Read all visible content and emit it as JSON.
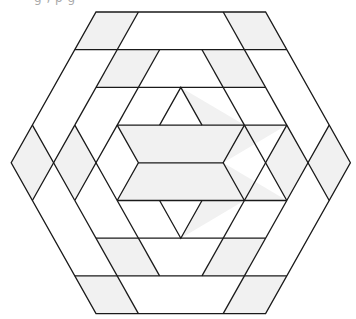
{
  "caption": "g          , p g",
  "colors": {
    "stroke": "#1a1a1a",
    "shade": "#f1f1f1",
    "background": "#ffffff"
  },
  "diagram": {
    "lattice_note": "triangular lattice; points given as [row, col], row 0..8, hexagon side = 4 units",
    "shaded_regions": [
      {
        "name": "top-left-parallelogram-outer",
        "pts": [
          [
            0,
            0
          ],
          [
            0,
            1
          ],
          [
            1,
            1
          ],
          [
            1,
            0
          ]
        ]
      },
      {
        "name": "top-right-parallelogram-outer",
        "pts": [
          [
            0,
            3
          ],
          [
            0,
            4
          ],
          [
            1,
            5
          ],
          [
            1,
            4
          ]
        ]
      },
      {
        "name": "top-left-parallelogram-inner",
        "pts": [
          [
            1,
            1
          ],
          [
            1,
            2
          ],
          [
            2,
            2
          ],
          [
            2,
            1
          ]
        ]
      },
      {
        "name": "top-right-parallelogram-inner",
        "pts": [
          [
            1,
            3
          ],
          [
            1,
            4
          ],
          [
            2,
            5
          ],
          [
            2,
            4
          ]
        ]
      },
      {
        "name": "top-triangle",
        "pts": [
          [
            2,
            3
          ],
          [
            3,
            5
          ],
          [
            3,
            4
          ]
        ]
      },
      {
        "name": "left-diamond-outer",
        "pts": [
          [
            3,
            0
          ],
          [
            4,
            1
          ],
          [
            5,
            0
          ],
          [
            4,
            0
          ]
        ]
      },
      {
        "name": "left-diamond-inner",
        "pts": [
          [
            3,
            1
          ],
          [
            4,
            2
          ],
          [
            5,
            1
          ],
          [
            4,
            1
          ]
        ]
      },
      {
        "name": "right-diamond-inner",
        "pts": [
          [
            3,
            6
          ],
          [
            4,
            7
          ],
          [
            5,
            6
          ],
          [
            4,
            6
          ]
        ]
      },
      {
        "name": "right-diamond-outer",
        "pts": [
          [
            3,
            7
          ],
          [
            4,
            8
          ],
          [
            5,
            7
          ],
          [
            4,
            7
          ]
        ]
      },
      {
        "name": "center-upper-trapezoid",
        "pts": [
          [
            3,
            2
          ],
          [
            3,
            6
          ],
          [
            4,
            5
          ],
          [
            4,
            3
          ]
        ]
      },
      {
        "name": "center-lower-trapezoid",
        "pts": [
          [
            4,
            3
          ],
          [
            4,
            5
          ],
          [
            5,
            6
          ],
          [
            5,
            2
          ]
        ]
      },
      {
        "name": "bottom-triangle",
        "pts": [
          [
            5,
            4
          ],
          [
            5,
            5
          ],
          [
            6,
            3
          ]
        ]
      },
      {
        "name": "bottom-left-parallelogram-inner",
        "pts": [
          [
            6,
            1
          ],
          [
            6,
            2
          ],
          [
            7,
            2
          ],
          [
            7,
            1
          ]
        ]
      },
      {
        "name": "bottom-right-parallelogram-inner",
        "pts": [
          [
            6,
            4
          ],
          [
            6,
            5
          ],
          [
            7,
            4
          ],
          [
            7,
            3
          ]
        ]
      },
      {
        "name": "bottom-left-parallelogram-outer",
        "pts": [
          [
            7,
            0
          ],
          [
            7,
            1
          ],
          [
            8,
            1
          ],
          [
            8,
            0
          ]
        ]
      },
      {
        "name": "bottom-right-parallelogram-outer",
        "pts": [
          [
            7,
            4
          ],
          [
            7,
            5
          ],
          [
            8,
            4
          ],
          [
            8,
            3
          ]
        ]
      }
    ],
    "lines": [
      {
        "name": "outer-hexagon",
        "closed": true,
        "pts": [
          [
            0,
            0
          ],
          [
            0,
            4
          ],
          [
            4,
            8
          ],
          [
            8,
            4
          ],
          [
            8,
            0
          ],
          [
            4,
            0
          ]
        ]
      },
      {
        "name": "row1-line",
        "pts": [
          [
            1,
            0
          ],
          [
            1,
            5
          ]
        ]
      },
      {
        "name": "row2-line",
        "pts": [
          [
            2,
            1
          ],
          [
            2,
            5
          ]
        ]
      },
      {
        "name": "row3-line",
        "pts": [
          [
            3,
            2
          ],
          [
            3,
            6
          ]
        ]
      },
      {
        "name": "row4-center-line",
        "pts": [
          [
            4,
            3
          ],
          [
            4,
            5
          ]
        ]
      },
      {
        "name": "row5-line",
        "pts": [
          [
            5,
            2
          ],
          [
            5,
            6
          ]
        ]
      },
      {
        "name": "row6-line",
        "pts": [
          [
            6,
            1
          ],
          [
            6,
            5
          ]
        ]
      },
      {
        "name": "row7-line",
        "pts": [
          [
            7,
            0
          ],
          [
            7,
            5
          ]
        ]
      },
      {
        "name": "left-band-outer-diag-top",
        "pts": [
          [
            0,
            1
          ],
          [
            3,
            1
          ]
        ]
      },
      {
        "name": "left-band-inner-diag-top",
        "pts": [
          [
            1,
            2
          ],
          [
            3,
            2
          ]
        ]
      },
      {
        "name": "right-band-outer-diag-top",
        "pts": [
          [
            0,
            3
          ],
          [
            3,
            6
          ]
        ]
      },
      {
        "name": "right-band-inner-diag-top",
        "pts": [
          [
            1,
            3
          ],
          [
            3,
            5
          ]
        ]
      },
      {
        "name": "left-band-outer-diag-bottom",
        "pts": [
          [
            5,
            1
          ],
          [
            8,
            1
          ]
        ]
      },
      {
        "name": "left-band-inner-diag-bottom",
        "pts": [
          [
            5,
            2
          ],
          [
            7,
            2
          ]
        ]
      },
      {
        "name": "right-band-outer-diag-bottom",
        "pts": [
          [
            5,
            6
          ],
          [
            8,
            3
          ]
        ]
      },
      {
        "name": "right-band-inner-diag-bottom",
        "pts": [
          [
            5,
            5
          ],
          [
            7,
            3
          ]
        ]
      },
      {
        "name": "left-zigzag-1",
        "pts": [
          [
            3,
            0
          ],
          [
            4,
            1
          ],
          [
            5,
            0
          ]
        ]
      },
      {
        "name": "left-zigzag-2",
        "pts": [
          [
            3,
            1
          ],
          [
            4,
            1
          ],
          [
            5,
            1
          ]
        ]
      },
      {
        "name": "left-zigzag-3",
        "pts": [
          [
            3,
            1
          ],
          [
            4,
            2
          ],
          [
            5,
            1
          ]
        ]
      },
      {
        "name": "left-zigzag-4",
        "pts": [
          [
            3,
            2
          ],
          [
            4,
            2
          ],
          [
            5,
            2
          ]
        ]
      },
      {
        "name": "left-zigzag-5",
        "pts": [
          [
            3,
            2
          ],
          [
            4,
            3
          ],
          [
            5,
            2
          ]
        ]
      },
      {
        "name": "right-zigzag-1",
        "pts": [
          [
            3,
            7
          ],
          [
            4,
            7
          ],
          [
            5,
            7
          ]
        ]
      },
      {
        "name": "right-zigzag-2",
        "pts": [
          [
            3,
            6
          ],
          [
            4,
            7
          ],
          [
            5,
            6
          ]
        ]
      },
      {
        "name": "right-zigzag-3",
        "pts": [
          [
            3,
            6
          ],
          [
            4,
            6
          ],
          [
            5,
            6
          ]
        ]
      },
      {
        "name": "right-zigzag-4",
        "pts": [
          [
            3,
            5
          ],
          [
            4,
            6
          ],
          [
            5,
            5
          ]
        ]
      },
      {
        "name": "right-zigzag-5",
        "pts": [
          [
            3,
            5
          ],
          [
            4,
            5
          ],
          [
            5,
            5
          ]
        ]
      },
      {
        "name": "top-triangle-outline",
        "pts": [
          [
            3,
            3
          ],
          [
            2,
            3
          ],
          [
            3,
            4
          ]
        ]
      },
      {
        "name": "bottom-triangle-outline",
        "pts": [
          [
            5,
            3
          ],
          [
            6,
            3
          ],
          [
            5,
            4
          ]
        ]
      }
    ]
  }
}
